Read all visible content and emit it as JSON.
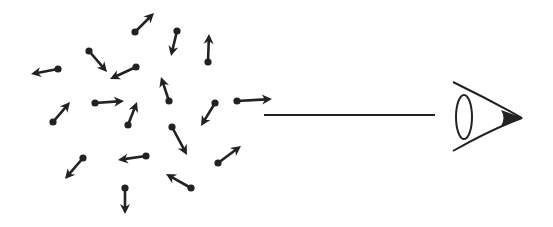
{
  "diagram": {
    "stroke_color": "#222222",
    "background": "#ffffff",
    "dipoles": [
      {
        "tail": [
          135,
          32
        ],
        "tip": [
          154,
          13
        ]
      },
      {
        "tail": [
          177,
          31
        ],
        "tip": [
          171,
          56
        ]
      },
      {
        "tail": [
          208,
          62
        ],
        "tip": [
          209,
          34
        ]
      },
      {
        "tail": [
          89,
          51
        ],
        "tip": [
          107,
          72
        ]
      },
      {
        "tail": [
          136,
          67
        ],
        "tip": [
          110,
          79
        ]
      },
      {
        "tail": [
          58,
          69
        ],
        "tip": [
          31,
          74
        ]
      },
      {
        "tail": [
          169,
          101
        ],
        "tip": [
          161,
          77
        ]
      },
      {
        "tail": [
          95,
          103
        ],
        "tip": [
          124,
          101
        ]
      },
      {
        "tail": [
          128,
          125
        ],
        "tip": [
          137,
          102
        ]
      },
      {
        "tail": [
          53,
          122
        ],
        "tip": [
          70,
          102
        ]
      },
      {
        "tail": [
          215,
          103
        ],
        "tip": [
          201,
          126
        ]
      },
      {
        "tail": [
          237,
          101
        ],
        "tip": [
          272,
          99
        ]
      },
      {
        "tail": [
          172,
          127
        ],
        "tip": [
          187,
          155
        ]
      },
      {
        "tail": [
          83,
          158
        ],
        "tip": [
          65,
          179
        ]
      },
      {
        "tail": [
          146,
          156
        ],
        "tip": [
          118,
          160
        ]
      },
      {
        "tail": [
          218,
          163
        ],
        "tip": [
          241,
          146
        ]
      },
      {
        "tail": [
          191,
          188
        ],
        "tip": [
          166,
          174
        ]
      },
      {
        "tail": [
          125,
          188
        ],
        "tip": [
          125,
          214
        ]
      }
    ],
    "line_of_sight": {
      "from": [
        264,
        115
      ],
      "to": [
        435,
        115
      ]
    },
    "eye": {
      "icon": "eye-icon",
      "x": 452,
      "y": 82,
      "width": 72,
      "height": 70
    }
  }
}
